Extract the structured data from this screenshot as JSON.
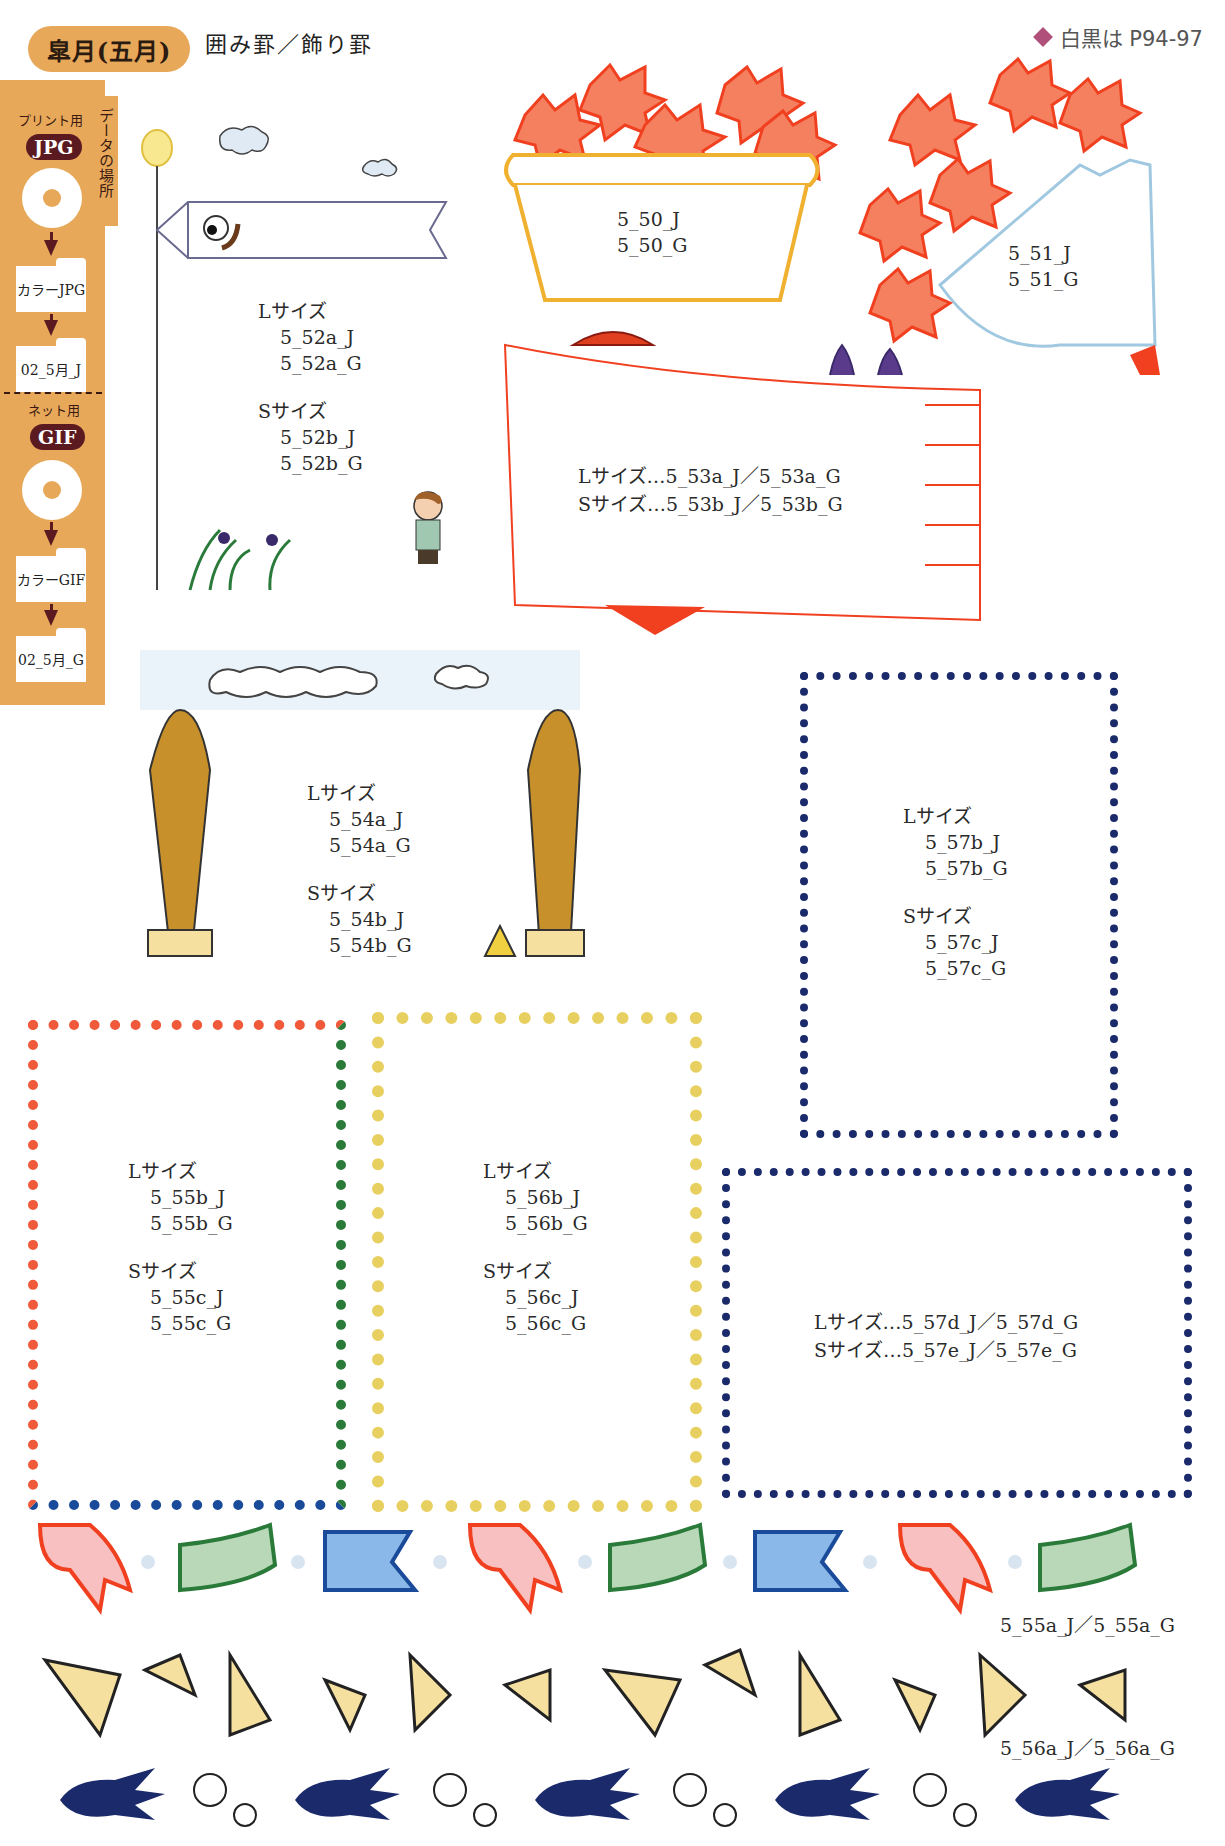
{
  "header": {
    "month_title": "皐月(五月)",
    "subtitle": "囲み罫／飾り罫",
    "page_reference": "白黒は P94-97"
  },
  "sidebar": {
    "vertical_label": "データの場所",
    "print": {
      "label": "プリント用",
      "format_badge": "JPG",
      "folder_1": "カラーJPG",
      "folder_2": "02_5月_J"
    },
    "net": {
      "label": "ネット用",
      "format_badge": "GIF",
      "folder_1": "カラーGIF",
      "folder_2": "02_5月_G"
    }
  },
  "items": {
    "carnation_basket": {
      "lines": [
        "5_50_J",
        "5_50_G"
      ]
    },
    "carnation_bouquet": {
      "lines": [
        "5_51_J",
        "5_51_G"
      ]
    },
    "koinobori_pole": {
      "l_label": "Lサイズ",
      "l_files": [
        "5_52a_J",
        "5_52a_G"
      ],
      "s_label": "Sサイズ",
      "s_files": [
        "5_52b_J",
        "5_52b_G"
      ]
    },
    "koinobori_big": {
      "l_line": "Lサイズ…5_53a_J／5_53a_G",
      "s_line": "Sサイズ…5_53b_J／5_53b_G"
    },
    "bamboo_shoot": {
      "l_label": "Lサイズ",
      "l_files": [
        "5_54a_J",
        "5_54a_G"
      ],
      "s_label": "Sサイズ",
      "s_files": [
        "5_54b_J",
        "5_54b_G"
      ]
    },
    "koinobori_frame": {
      "l_label": "Lサイズ",
      "l_files": [
        "5_55b_J",
        "5_55b_G"
      ],
      "s_label": "Sサイズ",
      "s_files": [
        "5_55c_J",
        "5_55c_G"
      ]
    },
    "takenoko_frame": {
      "l_label": "Lサイズ",
      "l_files": [
        "5_56b_J",
        "5_56b_G"
      ],
      "s_label": "Sサイズ",
      "s_files": [
        "5_56c_J",
        "5_56c_G"
      ]
    },
    "swallow_frame_tall": {
      "l_label": "Lサイズ",
      "l_files": [
        "5_57b_J",
        "5_57b_G"
      ],
      "s_label": "Sサイズ",
      "s_files": [
        "5_57c_J",
        "5_57c_G"
      ]
    },
    "swallow_frame_wide": {
      "l_line": "Lサイズ…5_57d_J／5_57d_G",
      "s_line": "Sサイズ…5_57e_J／5_57e_G"
    },
    "koinobori_line": {
      "label": "5_55a_J／5_55a_G"
    },
    "takenoko_line": {
      "label": "5_56a_J／5_56a_G"
    }
  },
  "colors": {
    "accent_orange": "#e8a85a",
    "badge_dark": "#5a1a20",
    "diamond_pink": "#b0507a",
    "carnation_red": "#f05030",
    "basket_yellow": "#f0b030",
    "swallow_blue": "#1a2a6a",
    "koi_red": "#f04020",
    "koi_green": "#2a7a3a",
    "koi_blue": "#1a4a9a",
    "takenoko_yellow": "#f0e040"
  }
}
